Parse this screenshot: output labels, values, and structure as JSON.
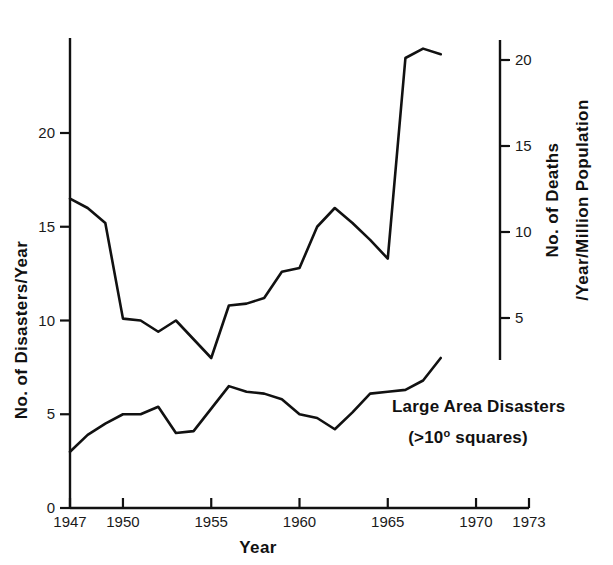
{
  "chart_data": {
    "type": "line",
    "title": "",
    "xlabel": "Year",
    "ylabel": "No. of Disasters/Year",
    "ylabel_right_line1": "No. of Deaths",
    "ylabel_right_line2": "/Year/Million Population",
    "grid": false,
    "legend_position": "inline-annotation",
    "xlim": [
      1947,
      1973
    ],
    "ylim_left": [
      0,
      25
    ],
    "ylim_right": [
      0,
      22.9
    ],
    "x_ticks": [
      1947,
      1950,
      1955,
      1960,
      1965,
      1970,
      1973
    ],
    "x_tick_labels": [
      "1947",
      "1950",
      "1955",
      "1960",
      "1965",
      "1970",
      "1973"
    ],
    "y_ticks_left": [
      0,
      5,
      10,
      15,
      20
    ],
    "y_tick_labels_left": [
      "0",
      "5",
      "10",
      "15",
      "20"
    ],
    "y_ticks_right": [
      5,
      10,
      15,
      20
    ],
    "y_tick_labels_right": [
      "5",
      "10",
      "15",
      "20"
    ],
    "annotations": [
      {
        "name": "large-area-disasters-label",
        "line1": "Large Area Disasters",
        "line2_prefix": "(>10",
        "line2_sup": "o",
        "line2_suffix": " squares)"
      }
    ],
    "series": [
      {
        "name": "All Disasters",
        "axis": "left",
        "x": [
          1947,
          1948,
          1949,
          1950,
          1951,
          1952,
          1953,
          1954,
          1955,
          1956,
          1957,
          1958,
          1959,
          1960,
          1961,
          1962,
          1963,
          1964,
          1965,
          1966,
          1967,
          1968
        ],
        "values": [
          16.5,
          16.0,
          15.2,
          10.1,
          10.0,
          9.4,
          10.0,
          9.0,
          8.0,
          10.8,
          10.9,
          11.2,
          12.6,
          12.8,
          15.0,
          16.0,
          15.2,
          14.3,
          13.3,
          24.0,
          24.5,
          24.2
        ]
      },
      {
        "name": "Large Area Disasters",
        "axis": "left",
        "x": [
          1947,
          1948,
          1949,
          1950,
          1951,
          1952,
          1953,
          1954,
          1955,
          1956,
          1957,
          1958,
          1959,
          1960,
          1961,
          1962,
          1963,
          1964,
          1965,
          1966,
          1967,
          1968
        ],
        "values": [
          3.0,
          3.9,
          4.5,
          5.0,
          5.0,
          5.4,
          4.0,
          4.1,
          5.3,
          6.5,
          6.2,
          6.1,
          5.8,
          5.0,
          4.8,
          4.2,
          5.1,
          6.1,
          6.2,
          6.3,
          6.8,
          8.0
        ]
      }
    ]
  }
}
